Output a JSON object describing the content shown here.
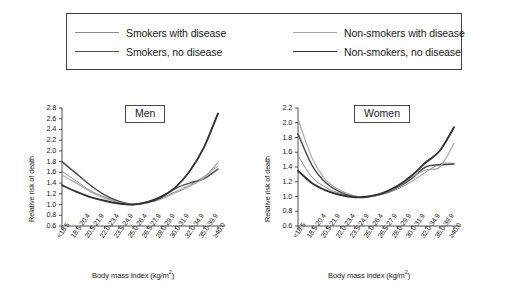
{
  "legend": {
    "entries": [
      {
        "label": "Smokers with disease",
        "color": "#8c8c8c",
        "width": 1.0,
        "key": "smokers_disease"
      },
      {
        "label": "Smokers, no disease",
        "color": "#4d4d4d",
        "width": 1.5,
        "key": "smokers_nodisease"
      },
      {
        "label": "Non-smokers with disease",
        "color": "#a8a8a8",
        "width": 1.2,
        "key": "nonsmokers_disease"
      },
      {
        "label": "Non-smokers, no disease",
        "color": "#333333",
        "width": 1.9,
        "key": "nonsmokers_nodisease"
      }
    ]
  },
  "chart_data": [
    {
      "type": "line",
      "title": "Men",
      "xlabel": "Body mass index (kg/m2)",
      "ylabel": "Relative risk of death",
      "ylim": [
        0.6,
        2.8
      ],
      "ytick_step": 0.2,
      "yticks": [
        "0.6",
        "0.8",
        "1.0",
        "1.2",
        "1.4",
        "1.6",
        "1.8",
        "2.0",
        "2.2",
        "2.4",
        "2.6",
        "2.8"
      ],
      "grid": false,
      "legend_position": "top",
      "categories": [
        "<18.5",
        "18.5-20.4",
        "20.5-21.9",
        "22.0-23.4",
        "23.5-24.9",
        "25.0-26.4",
        "26.5-27.9",
        "28.0-29.9",
        "30.0-31.9",
        "32.0-34.9",
        "35.0-39.9",
        "≥40.0"
      ],
      "x_categories_shown": [
        "<18.5",
        "18.5-20.4",
        "20.5-21.9",
        "22.0-23.4",
        "23.5-24.9",
        "25.0-26.4",
        "26.5-27.9",
        "28.0-29.9",
        "30.0-31.9",
        "32.0-34.9",
        "35.0-39.9",
        "≥40.0"
      ],
      "series": [
        {
          "name": "Smokers with disease",
          "values": [
            1.62,
            1.44,
            1.26,
            1.14,
            1.05,
            1.0,
            1.04,
            1.12,
            1.24,
            1.36,
            1.52,
            1.72
          ]
        },
        {
          "name": "Smokers, no disease",
          "values": [
            1.8,
            1.58,
            1.36,
            1.18,
            1.06,
            1.0,
            1.05,
            1.15,
            1.3,
            1.4,
            1.48,
            1.66
          ]
        },
        {
          "name": "Non-smokers with disease",
          "values": [
            1.55,
            1.4,
            1.24,
            1.12,
            1.04,
            1.0,
            1.03,
            1.1,
            1.22,
            1.34,
            1.5,
            1.78
          ]
        },
        {
          "name": "Non-smokers, no disease",
          "values": [
            1.36,
            1.24,
            1.14,
            1.07,
            1.02,
            1.0,
            1.04,
            1.14,
            1.32,
            1.62,
            2.06,
            2.7
          ]
        }
      ]
    },
    {
      "type": "line",
      "title": "Women",
      "xlabel": "Body mass index (kg/m2)",
      "ylabel": "Relative risk of death",
      "ylim": [
        0.6,
        2.2
      ],
      "ytick_step": 0.2,
      "yticks": [
        "0.6",
        "0.8",
        "1.0",
        "1.2",
        "1.4",
        "1.6",
        "1.8",
        "2.0",
        "2.2"
      ],
      "grid": false,
      "legend_position": "top",
      "categories": [
        "<18.5",
        "18.5-20.4",
        "20.5-21.9",
        "22.0-23.4",
        "23.5-24.9",
        "25.0-26.4",
        "26.5-27.9",
        "28.0-29.9",
        "30.0-31.9",
        "32.0-34.9",
        "35.0-39.9",
        "≥40.0"
      ],
      "x_categories_shown": [
        "<18.5",
        "18.5-20.4",
        "20.5-21.9",
        "22.0-23.4",
        "23.5-24.9",
        "25.0-26.4",
        "26.5-27.9",
        "28.0-29.9",
        "30.0-31.9",
        "32.0-34.9",
        "35.0-39.9",
        "≥40.0"
      ],
      "series": [
        {
          "name": "Smokers with disease",
          "values": [
            1.55,
            1.26,
            1.12,
            1.04,
            1.0,
            1.0,
            1.03,
            1.1,
            1.2,
            1.33,
            1.44,
            1.45
          ]
        },
        {
          "name": "Smokers, no disease",
          "values": [
            1.85,
            1.42,
            1.18,
            1.06,
            1.0,
            1.0,
            1.04,
            1.12,
            1.24,
            1.4,
            1.43,
            1.44
          ]
        },
        {
          "name": "Non-smokers with disease",
          "values": [
            2.05,
            1.52,
            1.22,
            1.08,
            1.01,
            1.0,
            1.04,
            1.13,
            1.26,
            1.36,
            1.4,
            1.72
          ]
        },
        {
          "name": "Non-smokers, no disease",
          "values": [
            1.35,
            1.18,
            1.08,
            1.02,
            0.99,
            1.0,
            1.05,
            1.14,
            1.28,
            1.46,
            1.62,
            1.94
          ]
        }
      ]
    }
  ]
}
